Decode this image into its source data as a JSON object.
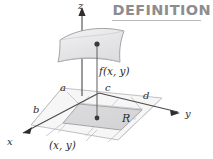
{
  "header": {
    "title": "DEFINITION",
    "rule_color": "#b9b9bb",
    "text_color": "#8d8d8f"
  },
  "figure": {
    "background": "#ffffff",
    "axis_color": "#4a4a4a",
    "grid_color": "#b0b0b2",
    "surface_fill": "#e9e9ea",
    "surface_stroke": "#9a9a9c",
    "region_fill": "#d8d8da",
    "plane_fill": "#f2f2f3",
    "point_color": "#3a3a3a",
    "axes": [
      {
        "name": "z",
        "label": "z"
      },
      {
        "name": "x",
        "label": "x"
      },
      {
        "name": "y",
        "label": "y"
      }
    ],
    "labels": {
      "z": "z",
      "x": "x",
      "y": "y",
      "a": "a",
      "b": "b",
      "c": "c",
      "d": "d",
      "region": "R",
      "height": "f(x, y)",
      "point": "(x, y)"
    }
  }
}
